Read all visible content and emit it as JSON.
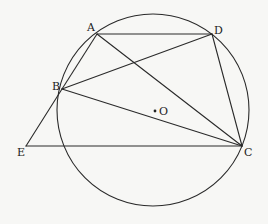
{
  "diagram": {
    "type": "geometry",
    "circle": {
      "name": "circle-O",
      "cx": 153,
      "cy": 110,
      "r": 96
    },
    "points": {
      "A": {
        "label": "A",
        "x": 97,
        "y": 34,
        "lx": 87,
        "ly": 31
      },
      "D": {
        "label": "D",
        "x": 212,
        "y": 34,
        "lx": 214,
        "ly": 34
      },
      "B": {
        "label": "B",
        "x": 62,
        "y": 89,
        "lx": 52,
        "ly": 90
      },
      "C": {
        "label": "C",
        "x": 242,
        "y": 146,
        "lx": 244,
        "ly": 156
      },
      "E": {
        "label": "E",
        "x": 26,
        "y": 146,
        "lx": 17,
        "ly": 156
      },
      "O": {
        "label": "O",
        "x": 155,
        "y": 111,
        "lx": 159,
        "ly": 115
      }
    },
    "segments": [
      {
        "name": "AD",
        "from": "A",
        "to": "D"
      },
      {
        "name": "AB",
        "from": "A",
        "to": "B"
      },
      {
        "name": "AC",
        "from": "A",
        "to": "C"
      },
      {
        "name": "BD",
        "from": "B",
        "to": "D"
      },
      {
        "name": "BC",
        "from": "B",
        "to": "C"
      },
      {
        "name": "DC",
        "from": "D",
        "to": "C"
      },
      {
        "name": "EB",
        "from": "E",
        "to": "B"
      },
      {
        "name": "EC",
        "from": "E",
        "to": "C"
      }
    ],
    "colors": {
      "stroke": "#2a2a2a",
      "background": "#f7f7f5",
      "text": "#222222"
    }
  }
}
